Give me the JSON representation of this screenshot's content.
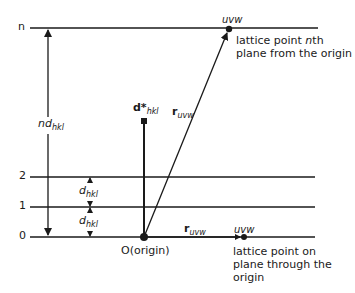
{
  "diagram": {
    "planes": [
      {
        "label": "n",
        "y": 28
      },
      {
        "label": "2",
        "y": 177
      },
      {
        "label": "1",
        "y": 207
      },
      {
        "label": "0",
        "y": 237
      }
    ],
    "labels": {
      "nd_main": "nd",
      "nd_sub": "hkl",
      "d1_main": "d",
      "d1_sub": "hkl",
      "d2_main": "d",
      "d2_sub": "hkl",
      "dstar_main": "d*",
      "dstar_sub": "hkl",
      "r_diag_main": "r",
      "r_diag_sub": "uvw",
      "r_horiz_main": "r",
      "r_horiz_sub": "uvw",
      "uvw_top": "uvw",
      "uvw_bottom": "uvw",
      "origin": "O(origin)",
      "top_point_line1_a": "lattice point ",
      "top_point_line1_b": "n",
      "top_point_line1_c": "th",
      "top_point_line2": "plane from the origin",
      "bottom_point_line1": "lattice point on",
      "bottom_point_line2": "plane through the",
      "bottom_point_line3": "origin"
    },
    "colors": {
      "stroke": "#1a1a1a",
      "background": "#ffffff"
    }
  }
}
